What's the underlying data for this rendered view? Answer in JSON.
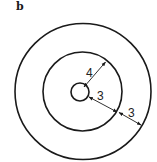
{
  "figure": {
    "panel_label": "b",
    "circles": [
      {
        "name": "inner",
        "cx": 80,
        "cy": 92,
        "r": 9
      },
      {
        "name": "middle",
        "cx": 82.5,
        "cy": 91.5,
        "r": 39.5
      },
      {
        "name": "outer",
        "cx": 83,
        "cy": 91.5,
        "r": 68
      }
    ],
    "dimensions": [
      {
        "label": "4",
        "from": "center",
        "to": "middle-circle"
      },
      {
        "label": "3",
        "from": "inner-circle",
        "to": "middle-circle"
      },
      {
        "label": "3",
        "from": "middle-circle",
        "to": "outer-circle"
      }
    ],
    "colors": {
      "stroke": "#1a1a1a",
      "background": "#ffffff"
    }
  }
}
